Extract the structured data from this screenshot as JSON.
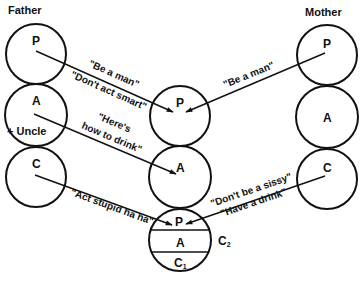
{
  "diagram": {
    "type": "script-matrix",
    "parents": {
      "father": {
        "label": "Father",
        "states": [
          "P",
          "A",
          "C"
        ],
        "extra_label": "+ Uncle"
      },
      "mother": {
        "label": "Mother",
        "states": [
          "P",
          "A",
          "C"
        ]
      }
    },
    "child": {
      "states": [
        "P",
        "A"
      ],
      "inner": {
        "states": [
          "P",
          "A",
          "C"
        ],
        "c1_label": "C",
        "c1_sub": "1",
        "c2_label": "C",
        "c2_sub": "2"
      }
    },
    "messages": [
      {
        "from": "father.P",
        "to": "child.P",
        "lines": [
          "\"Be a man\"",
          "\"Don't act smart\""
        ]
      },
      {
        "from": "mother.P",
        "to": "child.P",
        "lines": [
          "\"Be a man\""
        ]
      },
      {
        "from": "father.A",
        "to": "child.A",
        "lines": [
          "\"Here's",
          "how to drink\""
        ]
      },
      {
        "from": "father.C",
        "to": "child.C2.P",
        "lines": [
          "\"Act stupid ha ha\""
        ]
      },
      {
        "from": "mother.C",
        "to": "child.C2.P",
        "lines": [
          "\"Don't be a sissy\"",
          "\"Have a drink\""
        ]
      }
    ]
  }
}
